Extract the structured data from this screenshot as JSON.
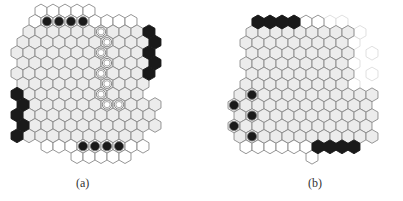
{
  "hex": {
    "w": 12,
    "row_h": 10.4,
    "size": 6.9
  },
  "colors": {
    "edge": "#8a8a8a",
    "interior": "#ececec",
    "border_cell": "#ffffff",
    "black": "#1a1a1a",
    "faint": "#dddddd"
  },
  "figures": [
    {
      "id": "a",
      "caption": "(a)",
      "origin": {
        "x": 17,
        "y": 11
      },
      "rows": [
        {
          "r": 0,
          "c0": 2,
          "n": 5,
          "type": "border"
        },
        {
          "r": 1,
          "c0": 1,
          "n": 9,
          "type": "border"
        },
        {
          "r": 2,
          "c0": 1,
          "n": 10,
          "type": "interior"
        },
        {
          "r": 3,
          "c0": 0,
          "n": 11,
          "type": "interior"
        },
        {
          "r": 4,
          "c0": 0,
          "n": 11,
          "type": "interior"
        },
        {
          "r": 5,
          "c0": 0,
          "n": 11,
          "type": "interior"
        },
        {
          "r": 6,
          "c0": 0,
          "n": 11,
          "type": "interior"
        },
        {
          "r": 7,
          "c0": 0,
          "n": 11,
          "type": "interior"
        },
        {
          "r": 8,
          "c0": 1,
          "n": 10,
          "type": "interior"
        },
        {
          "r": 9,
          "c0": 1,
          "n": 11,
          "type": "interior"
        },
        {
          "r": 10,
          "c0": 1,
          "n": 11,
          "type": "interior"
        },
        {
          "r": 11,
          "c0": 1,
          "n": 11,
          "type": "interior"
        },
        {
          "r": 12,
          "c0": 1,
          "n": 10,
          "type": "interior"
        },
        {
          "r": 13,
          "c0": 2,
          "n": 9,
          "type": "border"
        },
        {
          "r": 14,
          "c0": 5,
          "n": 5,
          "type": "border"
        }
      ],
      "black_hexes": [
        {
          "r": 2,
          "c": 11
        },
        {
          "r": 3,
          "c": 11
        },
        {
          "r": 4,
          "c": 11
        },
        {
          "r": 5,
          "c": 11
        },
        {
          "r": 6,
          "c": 11
        },
        {
          "r": 8,
          "c": 0
        },
        {
          "r": 9,
          "c": 0
        },
        {
          "r": 10,
          "c": 0
        },
        {
          "r": 11,
          "c": 0
        },
        {
          "r": 12,
          "c": 0
        }
      ],
      "black_discs": [
        {
          "r": 1,
          "c": 2
        },
        {
          "r": 1,
          "c": 3
        },
        {
          "r": 1,
          "c": 4
        },
        {
          "r": 1,
          "c": 5
        },
        {
          "r": 13,
          "c": 5
        },
        {
          "r": 13,
          "c": 6
        },
        {
          "r": 13,
          "c": 7
        },
        {
          "r": 13,
          "c": 8
        }
      ],
      "white_discs": [
        {
          "r": 2,
          "c": 7
        },
        {
          "r": 3,
          "c": 7
        },
        {
          "r": 4,
          "c": 7
        },
        {
          "r": 5,
          "c": 7
        },
        {
          "r": 6,
          "c": 7
        },
        {
          "r": 7,
          "c": 7
        },
        {
          "r": 8,
          "c": 7
        },
        {
          "r": 9,
          "c": 7
        },
        {
          "r": 9,
          "c": 8
        }
      ]
    },
    {
      "id": "b",
      "caption": "(b)",
      "origin": {
        "x": 46,
        "y": 22
      },
      "rows": [
        {
          "r": 0,
          "c0": 1,
          "n": 6,
          "type": "border"
        },
        {
          "r": 1,
          "c0": 0,
          "n": 9,
          "type": "interior"
        },
        {
          "r": 2,
          "c0": 0,
          "n": 9,
          "type": "interior"
        },
        {
          "r": 3,
          "c0": 0,
          "n": 9,
          "type": "interior"
        },
        {
          "r": 4,
          "c0": 0,
          "n": 9,
          "type": "interior"
        },
        {
          "r": 5,
          "c0": 0,
          "n": 9,
          "type": "interior"
        },
        {
          "r": 6,
          "c0": 0,
          "n": 9,
          "type": "interior"
        },
        {
          "r": 7,
          "c0": -1,
          "n": 12,
          "type": "interior"
        },
        {
          "r": 8,
          "c0": -1,
          "n": 12,
          "type": "interior"
        },
        {
          "r": 9,
          "c0": -1,
          "n": 12,
          "type": "interior"
        },
        {
          "r": 10,
          "c0": -1,
          "n": 12,
          "type": "interior"
        },
        {
          "r": 11,
          "c0": -1,
          "n": 12,
          "type": "interior"
        },
        {
          "r": 12,
          "c0": 0,
          "n": 6,
          "type": "border"
        },
        {
          "r": 13,
          "c0": 5,
          "n": 1,
          "type": "border"
        }
      ],
      "faint_hexes": [
        {
          "r": 0,
          "c": 7
        },
        {
          "r": 0,
          "c": 8
        },
        {
          "r": 1,
          "c": 9
        },
        {
          "r": 2,
          "c": 9
        },
        {
          "r": 3,
          "c": 10
        },
        {
          "r": 4,
          "c": 9
        },
        {
          "r": 5,
          "c": 10
        },
        {
          "r": 6,
          "c": 9
        }
      ],
      "black_hexes": [
        {
          "r": 0,
          "c": 1
        },
        {
          "r": 0,
          "c": 2
        },
        {
          "r": 0,
          "c": 3
        },
        {
          "r": 0,
          "c": 4
        },
        {
          "r": 12,
          "c": 6
        },
        {
          "r": 12,
          "c": 7
        },
        {
          "r": 12,
          "c": 8
        },
        {
          "r": 12,
          "c": 9
        }
      ],
      "black_discs": [
        {
          "r": 7,
          "c": 0
        },
        {
          "r": 8,
          "c": -1
        },
        {
          "r": 9,
          "c": 0
        },
        {
          "r": 10,
          "c": -1
        },
        {
          "r": 11,
          "c": 0
        }
      ],
      "white_discs": []
    }
  ]
}
